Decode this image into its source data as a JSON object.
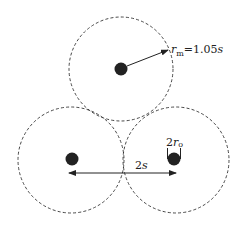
{
  "diagram": {
    "labels": {
      "radius_symbol": "r",
      "radius_sub": "m",
      "radius_value": "=1.05",
      "radius_unit": "s",
      "spacing_coef": "2",
      "spacing_unit": "s",
      "rod_coef": "2",
      "rod_symbol": "r",
      "rod_sub": "o"
    },
    "colors": {
      "stroke": "#333333",
      "dot": "#222222",
      "background": "#ffffff"
    },
    "circles": [
      {
        "name": "top",
        "cx": 121,
        "cy": 69,
        "r": 52
      },
      {
        "name": "bottom-left",
        "cx": 71,
        "cy": 160,
        "r": 53
      },
      {
        "name": "bottom-right",
        "cx": 176,
        "cy": 160,
        "r": 53
      }
    ]
  }
}
